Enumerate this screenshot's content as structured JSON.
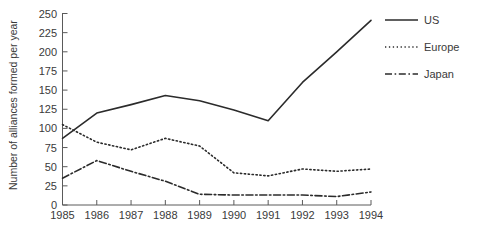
{
  "chart_data": {
    "type": "line",
    "title": "",
    "xlabel": "",
    "ylabel": "Number of alliances formed per year",
    "x": [
      1985,
      1986,
      1987,
      1988,
      1989,
      1990,
      1991,
      1992,
      1993,
      1994
    ],
    "xtick_labels": [
      "1985",
      "1986",
      "1987",
      "1988",
      "1989",
      "1990",
      "1991",
      "1992",
      "1993",
      "1994"
    ],
    "ytick_labels": [
      "0",
      "25",
      "50",
      "75",
      "100",
      "125",
      "150",
      "175",
      "200",
      "225",
      "250"
    ],
    "yticks": [
      0,
      25,
      50,
      75,
      100,
      125,
      150,
      175,
      200,
      225,
      250
    ],
    "xlim": [
      1985,
      1994
    ],
    "ylim": [
      0,
      250
    ],
    "grid": false,
    "legend_position": "top-right",
    "series": [
      {
        "name": "US",
        "style": "solid",
        "color": "#2b2b2b",
        "values": [
          87,
          120,
          131,
          143,
          136,
          124,
          110,
          160,
          200,
          241
        ]
      },
      {
        "name": "Europe",
        "style": "dotted",
        "color": "#2b2b2b",
        "values": [
          105,
          82,
          72,
          87,
          77,
          42,
          38,
          47,
          44,
          47
        ]
      },
      {
        "name": "Japan",
        "style": "dashdot",
        "color": "#2b2b2b",
        "values": [
          35,
          58,
          44,
          31,
          14,
          13,
          13,
          13,
          11,
          17
        ]
      }
    ]
  },
  "legend": {
    "items": [
      {
        "label": "US"
      },
      {
        "label": "Europe"
      },
      {
        "label": "Japan"
      }
    ]
  },
  "axes": {
    "y_title": "Number of alliances formed per year"
  }
}
